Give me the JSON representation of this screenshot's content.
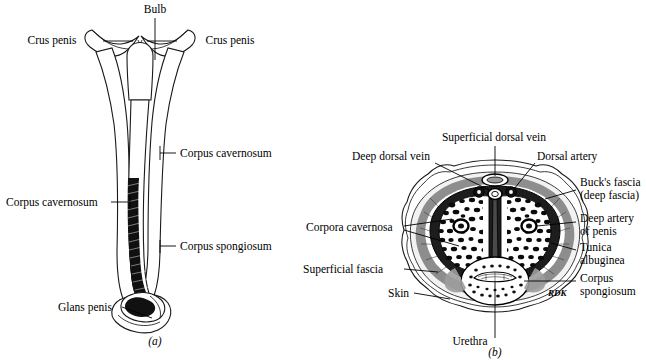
{
  "figure": {
    "panels": [
      {
        "id": "a",
        "caption": "(a)",
        "view_name": "penis-sagittal-posterior-view",
        "labels": [
          {
            "key": "bulb",
            "text": "Bulb",
            "x": 155,
            "y": 13,
            "anchor": "middle"
          },
          {
            "key": "crus_left",
            "text": "Crus penis",
            "x": 62,
            "y": 44,
            "anchor": "middle"
          },
          {
            "key": "crus_right",
            "text": "Crus penis",
            "x": 240,
            "y": 44,
            "anchor": "middle"
          },
          {
            "key": "corpus_cavernosum_right",
            "text": "Corpus cavernosum",
            "x": 178,
            "y": 157,
            "anchor": "start"
          },
          {
            "key": "corpus_cavernosum_left",
            "text": "Corpus cavernosum",
            "x": 4,
            "y": 206,
            "anchor": "start"
          },
          {
            "key": "corpus_spongiosum",
            "text": "Corpus spongiosum",
            "x": 178,
            "y": 250,
            "anchor": "start"
          },
          {
            "key": "glans_penis",
            "text": "Glans penis",
            "x": 60,
            "y": 311,
            "anchor": "start"
          }
        ]
      },
      {
        "id": "b",
        "caption": "(b)",
        "view_name": "penis-cross-section",
        "artist_signature": "RDK",
        "labels": [
          {
            "key": "superficial_dorsal_vein",
            "text": "Superficial dorsal vein",
            "x": 494,
            "y": 141,
            "anchor": "middle"
          },
          {
            "key": "deep_dorsal_vein",
            "text": "Deep dorsal vein",
            "x": 354,
            "y": 160,
            "anchor": "start"
          },
          {
            "key": "dorsal_artery",
            "text": "Dorsal artery",
            "x": 537,
            "y": 160,
            "anchor": "start"
          },
          {
            "key": "bucks_fascia_1",
            "text": "Buck's fascia",
            "x": 578,
            "y": 186,
            "anchor": "start"
          },
          {
            "key": "bucks_fascia_2",
            "text": "(deep fascia)",
            "x": 578,
            "y": 199,
            "anchor": "start"
          },
          {
            "key": "deep_artery_1",
            "text": "Deep artery",
            "x": 578,
            "y": 222,
            "anchor": "start"
          },
          {
            "key": "deep_artery_2",
            "text": "of penis",
            "x": 578,
            "y": 235,
            "anchor": "start"
          },
          {
            "key": "tunica_albuginea_1",
            "text": "Tunica",
            "x": 578,
            "y": 251,
            "anchor": "start"
          },
          {
            "key": "tunica_albuginea_2",
            "text": "albuginea",
            "x": 578,
            "y": 264,
            "anchor": "start"
          },
          {
            "key": "corpus_spongiosum_1",
            "text": "Corpus",
            "x": 578,
            "y": 282,
            "anchor": "start"
          },
          {
            "key": "corpus_spongiosum_2",
            "text": "spongiosum",
            "x": 578,
            "y": 295,
            "anchor": "start"
          },
          {
            "key": "corpora_cavernosa",
            "text": "Corpora cavernosa",
            "x": 310,
            "y": 228,
            "anchor": "start"
          },
          {
            "key": "superficial_fascia",
            "text": "Superficial fascia",
            "x": 306,
            "y": 272,
            "anchor": "start"
          },
          {
            "key": "skin",
            "text": "Skin",
            "x": 390,
            "y": 296,
            "anchor": "start"
          },
          {
            "key": "urethra",
            "text": "Urethra",
            "x": 470,
            "y": 345,
            "anchor": "middle"
          }
        ]
      }
    ]
  },
  "colors": {
    "ink": "#000000",
    "outline": "#1a1a1a",
    "fill_white": "#ffffff",
    "shade_dark": "#111111",
    "shade_mid": "#8e8e8e",
    "shade_light": "#c9c9c9",
    "background": "#ffffff"
  }
}
